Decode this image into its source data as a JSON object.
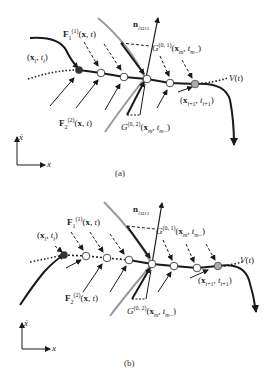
{
  "panels": [
    {
      "id": "a",
      "caption": "(a)",
      "labels": {
        "start_point": "(x_i, t_i)",
        "end_point": "(x_{i+1}, t_{i+1})",
        "force_1": "F_1^(1)(x, t)",
        "force_2": "F_2^(2)(x, t)",
        "normal": "n_∂Ω12",
        "g01": "G^(0,1)(x_m, t_m-)",
        "g02": "G^(0,2)(x_m, t_m-)",
        "boundary": "V(t)"
      },
      "axes": {
        "y": "ẋ",
        "x": "x"
      }
    },
    {
      "id": "b",
      "caption": "(b)",
      "labels": {
        "start_point": "(x_i, t_i)",
        "end_point": "(x_{i+1}, t_{i+1})",
        "force_1": "F_1^(1)(x, t)",
        "force_2": "F_2^(2)(x, t)",
        "normal": "n_∂Ω12",
        "g01": "G^(0,1)(x_m, t_m-)",
        "g02": "G^(0,2)(x_m, t_m-)",
        "boundary": "V(t)"
      },
      "axes": {
        "y": "ẋ",
        "x": "x"
      }
    }
  ],
  "colors": {
    "line": "#1a1a1a",
    "boundary_gray": "#999999",
    "start_dot": "#333333",
    "end_dot": "#aaaaaa"
  }
}
